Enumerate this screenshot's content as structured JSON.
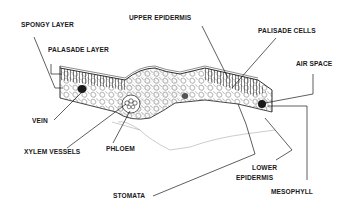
{
  "diagram": {
    "labels": {
      "spongy_layer": "SPONGY LAYER",
      "palasade_layer": "PALASADE LAYER",
      "upper_epidermis": "UPPER EPIDERMIS",
      "palisade_cells": "PALISADE CELLS",
      "air_space": "AIR SPACE",
      "vein": "VEIN",
      "xylem_vessels": "XYLEM VESSELS",
      "phloem": "PHLOEM",
      "stomata": "STOMATA",
      "lower_epidermis_line1": "LOWER",
      "lower_epidermis_line2": "EPIDERMIS",
      "mesophyll": "MESOPHYLL"
    },
    "colors": {
      "ink": "#1a1a1a",
      "fill": "#ffffff",
      "faint": "#999999"
    }
  }
}
